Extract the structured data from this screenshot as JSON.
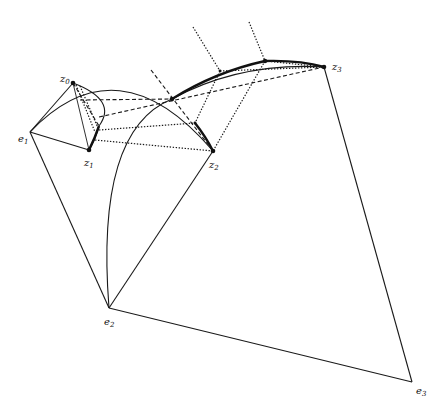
{
  "figure": {
    "type": "geometric-construction",
    "colors": {
      "ink": "#1a1a1a",
      "background": "#ffffff"
    }
  },
  "labels": {
    "z0": {
      "base": "z",
      "sub": "0"
    },
    "z1": {
      "base": "z",
      "sub": "1"
    },
    "z2": {
      "base": "z",
      "sub": "2"
    },
    "z3": {
      "base": "z",
      "sub": "3"
    },
    "e1": {
      "base": "e",
      "sub": "1"
    },
    "e2": {
      "base": "e",
      "sub": "2"
    },
    "e3": {
      "base": "e",
      "sub": "3"
    }
  },
  "points": {
    "z0": [
      73,
      83
    ],
    "z1": [
      89,
      150
    ],
    "z2": [
      213,
      151
    ],
    "z3": [
      324,
      67
    ],
    "e1": [
      30,
      132
    ],
    "e2": [
      109,
      308
    ],
    "e3": [
      412,
      382
    ],
    "p1": [
      172,
      99
    ],
    "p2": [
      220,
      71
    ],
    "p3": [
      265,
      61
    ],
    "p4": [
      195,
      123
    ],
    "p5": [
      99,
      126
    ]
  }
}
